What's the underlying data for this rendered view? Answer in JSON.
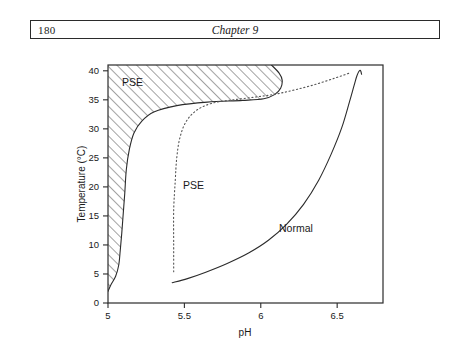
{
  "header": {
    "folio": "180",
    "chapter": "Chapter 9"
  },
  "chart_data": {
    "type": "line",
    "title": "",
    "xlabel": "pH",
    "ylabel": "Temperature (°C)",
    "xlim": [
      5.0,
      6.8
    ],
    "ylim": [
      0,
      41
    ],
    "xticks": [
      5,
      5.5,
      6,
      6.5
    ],
    "xtick_labels": [
      "5",
      "5.5",
      "6",
      "6.5"
    ],
    "yticks": [
      0,
      5,
      10,
      15,
      20,
      25,
      30,
      35,
      40
    ],
    "ytick_labels": [
      "0",
      "5",
      "10",
      "15",
      "20",
      "25",
      "30",
      "35",
      "40"
    ],
    "grid": false,
    "legend": "none",
    "annotations": [
      {
        "text": "PSE",
        "x": 5.16,
        "y": 37.4,
        "note": "inside hatched severe-PSE zone"
      },
      {
        "text": "PSE",
        "x": 5.56,
        "y": 19.6,
        "note": "region right of dotted boundary"
      },
      {
        "text": "Normal",
        "x": 6.23,
        "y": 12.2,
        "note": "region right of solid boundary"
      }
    ],
    "series": [
      {
        "name": "hatched-PSE-boundary",
        "style": "solid-filled-hatch",
        "description": "Right-hand boundary of the cross-hatched extreme PSE zone",
        "x": [
          5.0,
          5.02,
          5.05,
          5.07,
          5.08,
          5.09,
          5.1,
          5.11,
          5.12,
          5.14,
          5.17,
          5.22,
          5.3,
          5.45,
          5.65,
          5.88,
          6.02,
          6.09,
          6.13,
          6.14,
          6.12,
          6.07
        ],
        "y": [
          2.0,
          3.2,
          4.6,
          6.5,
          9.0,
          12.0,
          15.5,
          19.0,
          23.0,
          26.5,
          29.3,
          31.3,
          32.9,
          34.0,
          34.6,
          34.9,
          35.2,
          35.9,
          37.0,
          38.4,
          39.6,
          41.0
        ]
      },
      {
        "name": "dotted-PSE-boundary",
        "style": "dotted",
        "description": "Dotted curve separating mild PSE from the interior region",
        "x": [
          5.43,
          5.43,
          5.43,
          5.44,
          5.45,
          5.47,
          5.51,
          5.58,
          5.68,
          5.82,
          5.97,
          6.1,
          6.22,
          6.35,
          6.48,
          6.58
        ],
        "y": [
          5.4,
          10.0,
          16.0,
          21.0,
          25.0,
          28.4,
          31.2,
          33.2,
          34.4,
          35.0,
          35.5,
          36.0,
          36.7,
          37.6,
          38.7,
          39.6
        ]
      },
      {
        "name": "normal-boundary",
        "style": "solid",
        "description": "Solid curve separating PSE region from the Normal region",
        "x": [
          5.42,
          5.52,
          5.64,
          5.78,
          5.92,
          6.05,
          6.17,
          6.28,
          6.38,
          6.46,
          6.53,
          6.58,
          6.61,
          6.63,
          6.65,
          6.66
        ],
        "y": [
          3.5,
          4.2,
          5.3,
          6.8,
          8.6,
          10.8,
          13.6,
          17.0,
          21.2,
          25.6,
          30.2,
          34.6,
          37.4,
          39.2,
          40.1,
          39.4
        ]
      }
    ]
  }
}
